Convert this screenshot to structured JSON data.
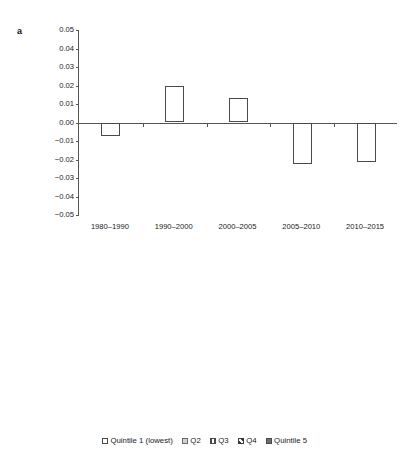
{
  "figure": {
    "panel_a_label": "a",
    "panel_b_label": "b",
    "caption": ""
  },
  "legend": {
    "items": [
      {
        "label": "Quintile 1 (lowest)",
        "swatch": "white-open-square-icon"
      },
      {
        "label": "Q2",
        "swatch": "light-gray-square-icon"
      },
      {
        "label": "Q3",
        "swatch": "vertical-stripe-square-icon"
      },
      {
        "label": "Q4",
        "swatch": "diagonal-hatch-square-icon"
      },
      {
        "label": "Quintile 5",
        "swatch": "dark-gray-square-icon"
      }
    ]
  },
  "chart_data": [
    {
      "type": "bar",
      "panel": "a",
      "title": "",
      "xlabel": "",
      "ylabel": "",
      "categories": [
        "1980–1990",
        "1990–2000",
        "2000–2005",
        "2005–2010",
        "2010–2015"
      ],
      "values": [
        -0.0075,
        0.0195,
        0.0135,
        -0.0225,
        -0.0215
      ],
      "ylim": [
        -0.05,
        0.05
      ],
      "yticks": [
        0.05,
        0.04,
        0.03,
        0.02,
        0.01,
        0.0,
        -0.01,
        -0.02,
        -0.03,
        -0.04,
        -0.05
      ],
      "ytick_labels": [
        "0.05",
        "0.04",
        "0.03",
        "0.02",
        "0.01",
        "0.00",
        "−0.01",
        "−0.02",
        "−0.03",
        "−0.04",
        "−0.05"
      ],
      "grid": false,
      "legend": "none"
    },
    {
      "type": "bar",
      "panel": "b",
      "title": "",
      "xlabel": "",
      "ylabel": "",
      "categories": [
        "1980–1990",
        "1990–2000",
        "2000–2005",
        "2005–2010",
        "2010–2015"
      ],
      "series": [
        {
          "name": "Quintile 1 (lowest)",
          "values": [
            -0.017,
            -0.004,
            -0.006,
            -0.033,
            -0.005
          ]
        },
        {
          "name": "Q2",
          "values": [
            0.015,
            0.022,
            0.0075,
            -0.019,
            -0.024
          ]
        },
        {
          "name": "Q3",
          "values": [
            -0.006,
            0.041,
            0.0165,
            -0.022,
            -0.027
          ]
        },
        {
          "name": "Q4",
          "values": [
            -0.021,
            0.03,
            0.0225,
            -0.0225,
            -0.028
          ]
        },
        {
          "name": "Quintile 5",
          "values": [
            -0.011,
            0.011,
            0.027,
            -0.021,
            -0.026
          ]
        }
      ],
      "ylim": [
        -0.05,
        0.05
      ],
      "yticks": [
        0.05,
        0.04,
        0.03,
        0.02,
        0.01,
        0,
        -0.01,
        -0.02,
        -0.03,
        -0.04,
        -0.05
      ],
      "ytick_labels": [
        "0.05",
        "0.04",
        "0.03",
        "0.02",
        "0.01",
        "0",
        "−0.01",
        "−0.02",
        "−0.03",
        "−0.04",
        "−0.05"
      ],
      "grid": false,
      "legend": "bottom"
    }
  ]
}
